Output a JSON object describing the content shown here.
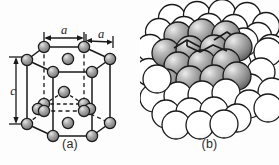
{
  "figure": {
    "background_color": "#fdfdfd",
    "width": 279,
    "height": 165
  },
  "panels": [
    {
      "id": "a",
      "caption": "(a)",
      "type": "reduced-sphere-unit-cell",
      "description": "Hexagonal prism unit cell drawn as reduced spheres with lattice edges",
      "colors": {
        "atom_fill": "#8f8f8f",
        "atom_highlight": "#d8d8d8",
        "atom_stroke": "#1a1a1a",
        "edge_solid": "#1a1a1a",
        "edge_hidden": "#1a1a1a",
        "label": "#1a1a1a"
      },
      "dimension_labels": [
        {
          "name": "a-top-left",
          "text": "a",
          "orientation": "horizontal",
          "style": "italic"
        },
        {
          "name": "a-top-right",
          "text": "a",
          "orientation": "horizontal",
          "style": "italic"
        },
        {
          "name": "c-left",
          "text": "c",
          "orientation": "vertical",
          "style": "italic"
        }
      ],
      "atom_counts": {
        "top_face_corners": 6,
        "top_face_center": 1,
        "bottom_face_corners": 6,
        "bottom_face_center": 1,
        "midplane_interior": 3,
        "total_drawn": 17
      }
    },
    {
      "id": "b",
      "caption": "(b)",
      "type": "hard-sphere-aggregate",
      "description": "Aggregate of many hard-sphere atoms with one HCP unit cell shaded gray",
      "colors": {
        "sphere_outline": "#1a1a1a",
        "sphere_plain_fill": "#ffffff",
        "sphere_shaded_light": "#e3e3e3",
        "sphere_shaded_mid": "#9a9a9a",
        "sphere_shaded_dark": "#5d5d5d",
        "cell_outline": "#1a1a1a"
      },
      "sphere_counts": {
        "plain_white": 44,
        "shaded_gray": 17
      }
    }
  ]
}
